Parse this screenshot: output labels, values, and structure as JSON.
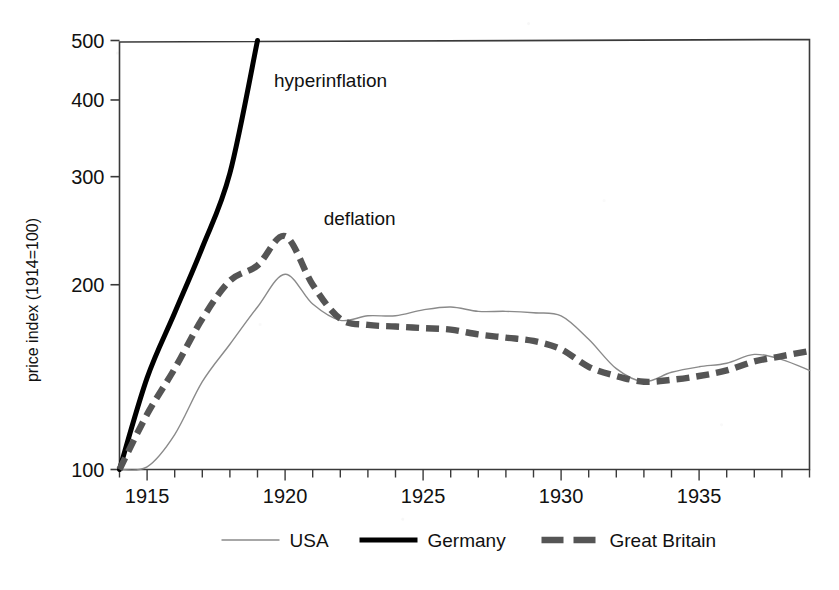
{
  "chart_data": {
    "type": "line",
    "title": "",
    "xlabel": "",
    "ylabel": "price index  (1914=100)",
    "yscale": "log",
    "ylim": [
      100,
      500
    ],
    "xlim": [
      1914,
      1939
    ],
    "grid": false,
    "frame": "box",
    "y_ticks": [
      100,
      200,
      300,
      400,
      500
    ],
    "y_tick_labels": [
      "100",
      "200",
      "300",
      "400",
      "500"
    ],
    "x_ticks": [
      1914,
      1915,
      1916,
      1917,
      1918,
      1919,
      1920,
      1921,
      1922,
      1923,
      1924,
      1925,
      1926,
      1927,
      1928,
      1929,
      1930,
      1931,
      1932,
      1933,
      1934,
      1935,
      1936,
      1937,
      1938,
      1939
    ],
    "x_tick_labels": [
      "1915",
      "1920",
      "1925",
      "1930",
      "1935"
    ],
    "x_labeled_ticks": [
      1915,
      1920,
      1925,
      1930,
      1935
    ],
    "legend_position": "bottom",
    "series": [
      {
        "name": "USA",
        "style": "thin-solid",
        "color": "#8a8a8a",
        "x": [
          1914,
          1915,
          1916,
          1917,
          1918,
          1919,
          1920,
          1921,
          1922,
          1923,
          1924,
          1925,
          1926,
          1927,
          1928,
          1929,
          1930,
          1931,
          1932,
          1933,
          1934,
          1935,
          1936,
          1937,
          1938,
          1939
        ],
        "values": [
          100,
          101,
          114,
          139,
          160,
          184,
          208,
          186,
          175,
          178,
          178,
          182,
          184,
          181,
          181,
          180,
          178,
          163,
          146,
          139,
          144,
          147,
          149,
          154,
          151,
          145
        ]
      },
      {
        "name": "Germany",
        "style": "thick-solid",
        "color": "#000000",
        "x": [
          1914,
          1915,
          1916,
          1917,
          1918,
          1919
        ],
        "values": [
          100,
          141,
          180,
          230,
          304,
          500
        ],
        "note": "line leaves the top of the plot between 1918 and 1919 (hyperinflation)"
      },
      {
        "name": "Great Britain",
        "style": "thick-dashed",
        "color": "#555555",
        "x": [
          1914,
          1915,
          1916,
          1917,
          1918,
          1919,
          1920,
          1921,
          1922,
          1923,
          1924,
          1925,
          1926,
          1927,
          1928,
          1929,
          1930,
          1931,
          1932,
          1933,
          1934,
          1935,
          1936,
          1937,
          1938,
          1939
        ],
        "values": [
          100,
          123,
          146,
          176,
          203,
          215,
          240,
          200,
          176,
          172,
          171,
          170,
          169,
          166,
          164,
          162,
          157,
          147,
          142,
          139,
          140,
          142,
          145,
          150,
          153,
          156
        ]
      }
    ],
    "annotations": [
      {
        "text": "hyperinflation",
        "x": 1919.6,
        "y": 420,
        "series": "Germany"
      },
      {
        "text": "deflation",
        "x": 1921.4,
        "y": 250,
        "series": "Great Britain"
      }
    ]
  },
  "legend": {
    "items": [
      {
        "label": "USA",
        "swatch": "thin-solid-line-swatch"
      },
      {
        "label": "Germany",
        "swatch": "thick-solid-line-swatch"
      },
      {
        "label": "Great Britain",
        "swatch": "thick-dashed-line-swatch"
      }
    ]
  },
  "axes": {
    "y_title": "price index  (1914=100)",
    "y_tick_0": "100",
    "y_tick_1": "200",
    "y_tick_2": "300",
    "y_tick_3": "400",
    "y_tick_4": "500",
    "x_tick_0": "1915",
    "x_tick_1": "1920",
    "x_tick_2": "1925",
    "x_tick_3": "1930",
    "x_tick_4": "1935"
  },
  "annotations": {
    "hyperinflation": "hyperinflation",
    "deflation": "deflation"
  }
}
